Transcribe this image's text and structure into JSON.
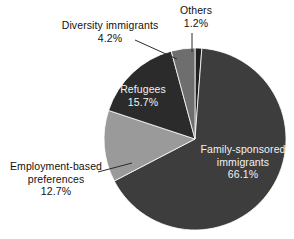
{
  "chart_data": {
    "type": "pie",
    "title": "",
    "subtitle": "",
    "xlabel": "",
    "ylabel": "",
    "legend_position": "none",
    "grid": false,
    "units": "percent",
    "start_angle_deg": 0,
    "direction": "clockwise",
    "categories": [
      "Others",
      "Family-sponsored immigrants",
      "Employment-based preferences",
      "Refugees",
      "Diversity immigrants"
    ],
    "values": [
      1.2,
      66.1,
      12.7,
      15.7,
      4.2
    ],
    "slices": [
      {
        "name": "others",
        "label": "Others",
        "value_label": "1.2%",
        "value": 1.2,
        "color": "#1f1f1f",
        "label_placement": "outside",
        "label_color": "#111111",
        "leader_line": true
      },
      {
        "name": "family-sponsored-immigrants",
        "label_line1": "Family-sponsored",
        "label_line2": "immigrants",
        "label": "Family-sponsored immigrants",
        "value_label": "66.1%",
        "value": 66.1,
        "color": "#3d3d3d",
        "label_placement": "inside",
        "label_color": "#f2f2f2",
        "leader_line": false
      },
      {
        "name": "employment-based-preferences",
        "label_line1": "Employment-based",
        "label_line2": "preferences",
        "label": "Employment-based preferences",
        "value_label": "12.7%",
        "value": 12.7,
        "color": "#9a9a9a",
        "label_placement": "outside",
        "label_color": "#111111",
        "leader_line": true
      },
      {
        "name": "refugees",
        "label": "Refugees",
        "value_label": "15.7%",
        "value": 15.7,
        "color": "#2b2b2b",
        "label_placement": "inside",
        "label_color": "#f2f2f2",
        "leader_line": false
      },
      {
        "name": "diversity-immigrants",
        "label": "Diversity immigrants",
        "value_label": "4.2%",
        "value": 4.2,
        "color": "#6e6e6e",
        "label_placement": "outside",
        "label_color": "#111111",
        "leader_line": true
      }
    ]
  },
  "labels": {
    "diversity_name": "Diversity immigrants",
    "diversity_value": "4.2%",
    "others_name": "Others",
    "others_value": "1.2%",
    "refugees_name": "Refugees",
    "refugees_value": "15.7%",
    "employment_name_line1": "Employment-based",
    "employment_name_line2": "preferences",
    "employment_value": "12.7%",
    "family_name_line1": "Family-sponsored",
    "family_name_line2": "immigrants",
    "family_value": "66.1%"
  },
  "colors": {
    "background": "#ffffff",
    "text": "#111111",
    "text_on_slice": "#f2f2f2",
    "leader_line": "#2b2b2b",
    "slice_others": "#1f1f1f",
    "slice_family": "#3d3d3d",
    "slice_employment": "#9a9a9a",
    "slice_refugees": "#2b2b2b",
    "slice_diversity": "#6e6e6e"
  }
}
